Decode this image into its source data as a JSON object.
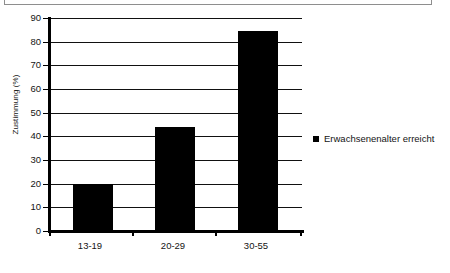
{
  "chart_data": {
    "type": "bar",
    "title": "",
    "subtitle": "",
    "xlabel": "",
    "ylabel": "Zustimmung (%)",
    "categories": [
      "13-19",
      "20-29",
      "30-55"
    ],
    "values": [
      20,
      44,
      84.5
    ],
    "series": [
      {
        "name": "Erwachsenenalter erreicht",
        "values": [
          20,
          44,
          84.5
        ],
        "color": "#000000"
      }
    ],
    "ylim": [
      0,
      90
    ],
    "ytick_step": 10,
    "yticks": [
      0,
      10,
      20,
      30,
      40,
      50,
      60,
      70,
      80,
      90
    ],
    "ytick_labels": [
      "0",
      "10",
      "20",
      "30",
      "40",
      "50",
      "60",
      "70",
      "80",
      "90"
    ],
    "grid": "horizontal",
    "legend_position": "right",
    "legend_entries": [
      {
        "label": "Erwachsenenalter erreicht",
        "color": "#000000",
        "marker": "square"
      }
    ]
  },
  "figure": {
    "background": "#ffffff",
    "frame_color": "#8e8e8e",
    "axis_color": "#000000",
    "gridline_color": "#111111",
    "text_color": "#141414"
  }
}
